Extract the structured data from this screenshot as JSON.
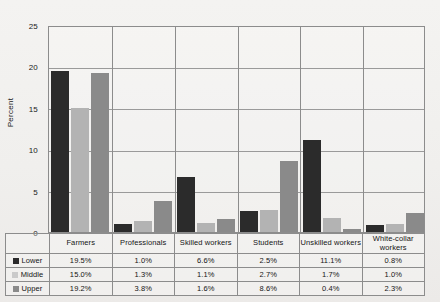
{
  "chart_data": {
    "type": "bar",
    "title": "",
    "xlabel": "",
    "ylabel": "Percent",
    "ylim": [
      0,
      25
    ],
    "yticks": [
      0,
      5,
      10,
      15,
      20,
      25
    ],
    "ytick_labels": [
      "0",
      "5",
      "10",
      "15",
      "20",
      "25"
    ],
    "grid": true,
    "legend_position": "bottom-table",
    "categories": [
      "Farmers",
      "Professionals",
      "Skilled workers",
      "Students",
      "Unskilled workers",
      "White-collar workers"
    ],
    "series": [
      {
        "name": "Lower",
        "color": "#2b2b2b",
        "values": [
          19.5,
          1.0,
          6.6,
          2.5,
          11.1,
          0.8
        ],
        "labels": [
          "19.5%",
          "1.0%",
          "6.6%",
          "2.5%",
          "11.1%",
          "0.8%"
        ]
      },
      {
        "name": "Middle",
        "color": "#b3b3b3",
        "values": [
          15.0,
          1.3,
          1.1,
          2.7,
          1.7,
          1.0
        ],
        "labels": [
          "15.0%",
          "1.3%",
          "1.1%",
          "2.7%",
          "1.7%",
          "1.0%"
        ]
      },
      {
        "name": "Upper",
        "color": "#8a8a8a",
        "values": [
          19.2,
          3.8,
          1.6,
          8.6,
          0.4,
          2.3
        ],
        "labels": [
          "19.2%",
          "3.8%",
          "1.6%",
          "8.6%",
          "0.4%",
          "2.3%"
        ]
      }
    ]
  },
  "table": {
    "column_headers": [
      "Farmers",
      "Professionals",
      "Skilled workers",
      "Students",
      "Unskilled workers",
      "White-collar workers"
    ],
    "rows": [
      {
        "label": "Lower",
        "swatch": "#2b2b2b",
        "cells": [
          "19.5%",
          "1.0%",
          "6.6%",
          "2.5%",
          "11.1%",
          "0.8%"
        ]
      },
      {
        "label": "Middle",
        "swatch": "#cacaca",
        "cells": [
          "15.0%",
          "1.3%",
          "1.1%",
          "2.7%",
          "1.7%",
          "1.0%"
        ]
      },
      {
        "label": "Upper",
        "swatch": "#8a8a8a",
        "cells": [
          "19.2%",
          "3.8%",
          "1.6%",
          "8.6%",
          "0.4%",
          "2.3%"
        ]
      }
    ]
  }
}
